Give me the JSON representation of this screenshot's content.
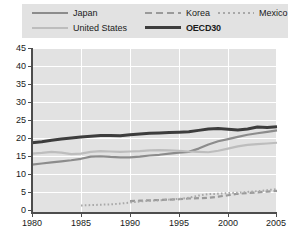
{
  "chart_data": {
    "type": "line",
    "title": "",
    "xlabel": "",
    "ylabel": "",
    "xlim": [
      1980,
      2005
    ],
    "ylim": [
      0,
      45
    ],
    "yticks": [
      0,
      5,
      10,
      15,
      20,
      25,
      30,
      35,
      40,
      45
    ],
    "xticks": [
      1980,
      1985,
      1990,
      1995,
      2000,
      2005
    ],
    "grid": "horizontal-and-vertical",
    "legend_position": "top",
    "plot_background": "#e2e2e2",
    "series": [
      {
        "name": "Japan",
        "color": "#8c8c8c",
        "style": "solid",
        "x": [
          1980,
          1981,
          1982,
          1983,
          1984,
          1985,
          1986,
          1987,
          1988,
          1989,
          1990,
          1991,
          1992,
          1993,
          1994,
          1995,
          1996,
          1997,
          1998,
          1999,
          2000,
          2001,
          2002,
          2003,
          2004,
          2005
        ],
        "values": [
          13.0,
          13.3,
          13.6,
          13.9,
          14.2,
          14.6,
          15.2,
          15.3,
          15.1,
          15.0,
          15.0,
          15.2,
          15.5,
          15.7,
          16.0,
          16.3,
          16.5,
          17.4,
          18.5,
          19.4,
          20.0,
          20.6,
          21.2,
          21.6,
          22.0,
          22.4
        ]
      },
      {
        "name": "United States",
        "color": "#bdbdbd",
        "style": "solid",
        "x": [
          1980,
          1981,
          1982,
          1983,
          1984,
          1985,
          1986,
          1987,
          1988,
          1989,
          1990,
          1991,
          1992,
          1993,
          1994,
          1995,
          1996,
          1997,
          1998,
          1999,
          2000,
          2001,
          2002,
          2003,
          2004,
          2005
        ],
        "values": [
          16.0,
          16.2,
          16.5,
          16.3,
          15.9,
          16.0,
          16.5,
          16.7,
          16.6,
          16.5,
          16.6,
          16.7,
          16.9,
          17.0,
          16.9,
          16.8,
          16.6,
          16.5,
          16.4,
          16.8,
          17.4,
          18.0,
          18.4,
          18.6,
          18.8,
          19.0
        ]
      },
      {
        "name": "Korea",
        "color": "#9a9a9a",
        "style": "dashed",
        "x": [
          1990,
          1991,
          1992,
          1993,
          1994,
          1995,
          1996,
          1997,
          1998,
          1999,
          2000,
          2001,
          2002,
          2003,
          2004,
          2005
        ],
        "values": [
          3.0,
          3.1,
          3.2,
          3.3,
          3.4,
          3.5,
          3.7,
          3.8,
          3.9,
          4.2,
          4.6,
          5.0,
          5.2,
          5.4,
          5.6,
          5.8
        ]
      },
      {
        "name": "Mexico",
        "color": "#a8a8a8",
        "style": "dotted",
        "x": [
          1985,
          1986,
          1987,
          1988,
          1989,
          1990,
          1991,
          1992,
          1993,
          1994,
          1995,
          1996,
          1997,
          1998,
          1999,
          2000,
          2001,
          2002,
          2003,
          2004,
          2005
        ],
        "values": [
          1.8,
          1.9,
          2.0,
          2.1,
          2.3,
          2.6,
          2.9,
          3.1,
          3.2,
          3.4,
          3.6,
          3.9,
          4.5,
          4.9,
          5.0,
          5.2,
          5.3,
          5.5,
          5.7,
          6.0,
          6.3
        ]
      },
      {
        "name": "OECD30",
        "color": "#3d3d3d",
        "style": "solid-bold",
        "x": [
          1980,
          1981,
          1982,
          1983,
          1984,
          1985,
          1986,
          1987,
          1988,
          1989,
          1990,
          1991,
          1992,
          1993,
          1994,
          1995,
          1996,
          1997,
          1998,
          1999,
          2000,
          2001,
          2002,
          2003,
          2004,
          2005
        ],
        "values": [
          19.0,
          19.3,
          19.7,
          20.0,
          20.3,
          20.6,
          20.8,
          21.0,
          21.0,
          20.9,
          21.2,
          21.4,
          21.6,
          21.7,
          21.8,
          21.9,
          22.0,
          22.4,
          22.8,
          22.9,
          22.7,
          22.5,
          22.8,
          23.3,
          23.2,
          23.4
        ]
      }
    ]
  },
  "legend": {
    "items": [
      {
        "label": "Japan",
        "swatch": "japan-line-swatch"
      },
      {
        "label": "Korea",
        "swatch": "korea-dashed-swatch"
      },
      {
        "label": "Mexico",
        "swatch": "mexico-dotted-swatch"
      },
      {
        "label": "United States",
        "swatch": "united-states-line-swatch"
      },
      {
        "label": "OECD30",
        "swatch": "oecd30-line-swatch"
      }
    ]
  },
  "axes": {
    "y_tick_labels": [
      "45",
      "40",
      "35",
      "30",
      "25",
      "20",
      "15",
      "10",
      "5",
      "0"
    ],
    "x_tick_labels": [
      "1980",
      "1985",
      "1990",
      "1995",
      "2000",
      "2005"
    ]
  }
}
